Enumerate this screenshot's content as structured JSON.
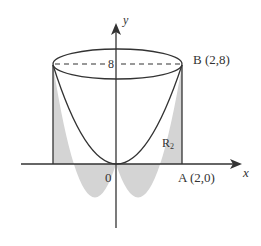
{
  "figure": {
    "axes": {
      "x_label": "x",
      "y_label": "y",
      "origin_label": "0"
    },
    "labels": {
      "height_tick": "8",
      "point_B": "B (2,8)",
      "point_A": "A (2,0)",
      "region_main": "R",
      "region_sub": "2"
    },
    "colors": {
      "stroke": "#333333",
      "shade": "#d4d4d4",
      "background": "#ffffff"
    },
    "curve": "y = 2x^2 rotated about y-axis forming a paraboloid inside a cylinder of radius 2, height 8"
  }
}
